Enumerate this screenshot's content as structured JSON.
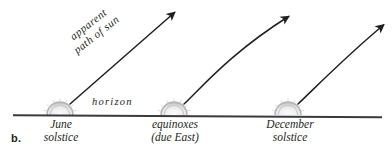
{
  "figure": {
    "part_letter": "b.",
    "caption_subject": "apparent path of sun at different times of year"
  },
  "labels": {
    "path_line1": "apparent",
    "path_line2": "path of sun",
    "horizon": "horizon"
  },
  "stations": [
    {
      "id": "june-solstice",
      "line1": "June",
      "line2": "solstice"
    },
    {
      "id": "equinoxes",
      "line1": "equinoxes",
      "line2": "(due East)"
    },
    {
      "id": "december-solstice",
      "line1": "December",
      "line2": "solstice"
    }
  ],
  "colors": {
    "ink": "#231f20",
    "horizon_line": "#3a3a3c",
    "arrow": "#231f20",
    "sun_fill": "#e9e9ea",
    "sun_stroke": "#b9b9bb",
    "background": "#ffffff"
  },
  "geometry": {
    "width": 392,
    "height": 159,
    "horizon_y": 115,
    "horizon_x_start": 13,
    "horizon_x_end": 382,
    "sun_centers_x": [
      60,
      174,
      288
    ],
    "sun_radius": 13,
    "arrows": [
      {
        "id": "arrow-june",
        "type": "straight",
        "start": [
          70,
          104
        ],
        "end": [
          176,
          11
        ]
      },
      {
        "id": "arrow-equinox",
        "type": "curved",
        "start": [
          184,
          104
        ],
        "end": [
          290,
          15
        ]
      },
      {
        "id": "arrow-december",
        "type": "curved",
        "start": [
          298,
          104
        ],
        "end": [
          385,
          24
        ]
      }
    ]
  }
}
